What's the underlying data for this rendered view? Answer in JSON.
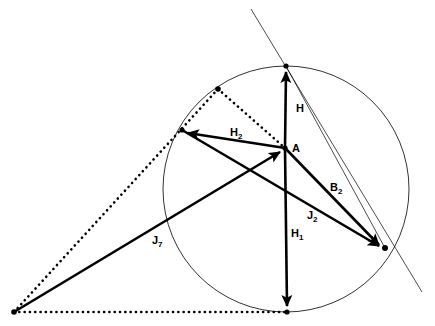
{
  "diagram": {
    "background_color": "#ffffff",
    "ink_color": "#000000",
    "canvas": {
      "width": 435,
      "height": 326
    },
    "labels": [
      {
        "id": "H",
        "base": "H",
        "sub": "",
        "x": 296,
        "y": 112
      },
      {
        "id": "A",
        "base": "A",
        "sub": "",
        "x": 292,
        "y": 152
      },
      {
        "id": "H2",
        "base": "H",
        "sub": "2",
        "x": 230,
        "y": 136
      },
      {
        "id": "B2",
        "base": "B",
        "sub": "2",
        "x": 330,
        "y": 191
      },
      {
        "id": "J2",
        "base": "J",
        "sub": "2",
        "x": 307,
        "y": 219
      },
      {
        "id": "H1",
        "base": "H",
        "sub": "1",
        "x": 291,
        "y": 237
      },
      {
        "id": "J7",
        "base": "J",
        "sub": "7",
        "x": 152,
        "y": 244
      }
    ],
    "circle": {
      "cx": 286,
      "cy": 189,
      "r": 123
    },
    "points": [
      {
        "id": "top",
        "x": 286,
        "y": 66,
        "marked": true
      },
      {
        "id": "A",
        "x": 285,
        "y": 148,
        "marked": true
      },
      {
        "id": "bottom",
        "x": 287,
        "y": 312,
        "marked": true
      },
      {
        "id": "left",
        "x": 182,
        "y": 130,
        "marked": true
      },
      {
        "id": "right",
        "x": 385,
        "y": 248,
        "marked": true
      },
      {
        "id": "dotted-apex",
        "x": 218,
        "y": 89,
        "marked": true
      },
      {
        "id": "far-left",
        "x": 14,
        "y": 312,
        "marked": true
      }
    ],
    "vectors": [
      {
        "id": "H",
        "from": "A",
        "to": "top",
        "style": "solid-arrow"
      },
      {
        "id": "H1",
        "from": "A",
        "to": "bottom",
        "style": "solid-arrow"
      },
      {
        "id": "H2",
        "from": "A",
        "to": "left",
        "style": "solid-arrow"
      },
      {
        "id": "B2",
        "from": "A",
        "to": "right",
        "style": "solid-arrow"
      },
      {
        "id": "J2",
        "from": "left",
        "to": "right",
        "style": "solid-arrow"
      },
      {
        "id": "J7",
        "from": "far-left",
        "to": "A",
        "style": "solid-arrow"
      }
    ],
    "dotted_paths": [
      {
        "id": "apex-to-A",
        "from": "dotted-apex",
        "to": "A"
      },
      {
        "id": "apex-to-farleft",
        "from": "dotted-apex",
        "to": "far-left"
      },
      {
        "id": "farleft-to-bottom",
        "from": "far-left",
        "to": "bottom"
      }
    ],
    "guide_lines": [
      {
        "id": "secant",
        "x1": 251,
        "y1": 9,
        "x2": 422,
        "y2": 292
      },
      {
        "id": "chord-top-right",
        "x1": 286,
        "y1": 66,
        "x2": 385,
        "y2": 248
      }
    ]
  }
}
